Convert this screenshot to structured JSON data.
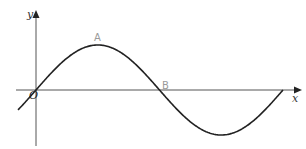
{
  "diagram": {
    "type": "sine-curve-graph",
    "axes": {
      "x_label": "x",
      "y_label": "y",
      "origin_label": "O",
      "axis_color": "#555555"
    },
    "curve": {
      "function": "y = sin x",
      "color": "#222222",
      "points_labelled": [
        {
          "label": "A",
          "description": "maximum point"
        },
        {
          "label": "B",
          "description": "x-intercept after the maximum"
        }
      ]
    },
    "label_color": "#9a9a9a"
  }
}
